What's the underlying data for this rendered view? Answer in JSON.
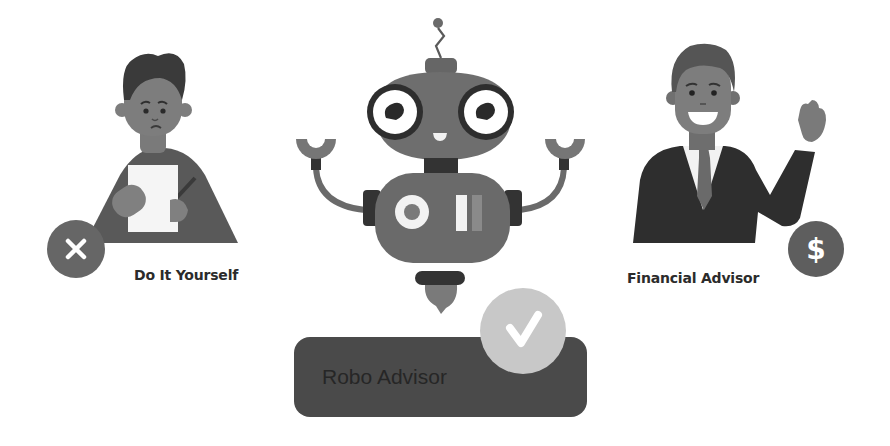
{
  "options": [
    {
      "id": "diy",
      "label": "Do It Yourself",
      "status": "rejected",
      "badge_icon": "x-icon",
      "figure": "worried-man-with-paper"
    },
    {
      "id": "robo",
      "label": "Robo Advisor",
      "status": "selected",
      "badge_icon": "checkmark-icon",
      "figure": "robot"
    },
    {
      "id": "advisor",
      "label": "Financial Advisor",
      "status": "neutral",
      "badge_icon": "dollar-icon",
      "badge_glyph": "$",
      "figure": "waving-man-in-suit"
    }
  ],
  "colors": {
    "background": "#ffffff",
    "label_text": "#2b2b2b",
    "robo_pill": "#4a4a4a",
    "check_badge": "#c8c8c8",
    "x_badge": "#666666",
    "dollar_badge": "#5e5e5e",
    "robot_body": "#6e6e6e",
    "robot_dark": "#333333",
    "skin": "#7d7d7d",
    "hair": "#3a3a3a",
    "suit": "#2e2e2e",
    "shirt": "#f2f2f2"
  }
}
